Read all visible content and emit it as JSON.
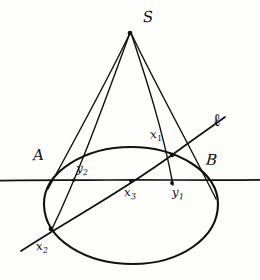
{
  "figure": {
    "kind": "hand-drawn-geometry-diagram",
    "ink_color": "#111111",
    "paper_color": "#fdfdfc",
    "width": 260,
    "height": 280
  },
  "labels": {
    "apex": {
      "text": "S",
      "x": 143,
      "y": 10
    },
    "left_point": {
      "text": "A",
      "x": 33,
      "y": 148
    },
    "right_point": {
      "text": "B",
      "x": 206,
      "y": 153
    },
    "line_l": {
      "text": "ℓ",
      "x": 213,
      "y": 114
    },
    "x1": {
      "base": "x",
      "sub": "1",
      "x": 150,
      "y": 128
    },
    "x2": {
      "base": "x",
      "sub": "2",
      "x": 36,
      "y": 240
    },
    "x3": {
      "base": "x",
      "sub": "3",
      "x": 124,
      "y": 186
    },
    "y1": {
      "base": "y",
      "sub": "1",
      "x": 172,
      "y": 186
    },
    "y2": {
      "base": "y",
      "sub": "2",
      "x": 76,
      "y": 162
    }
  },
  "geometry": {
    "ellipse": {
      "cx": 131,
      "cy": 205,
      "rx": 87,
      "ry": 58
    },
    "horizontal_line": {
      "x1": 0,
      "y1": 180,
      "x2": 260,
      "y2": 180
    },
    "point_S": {
      "x": 130,
      "y": 32
    },
    "point_A": {
      "x": 50,
      "y": 180
    },
    "point_B": {
      "x": 212,
      "y": 180
    },
    "point_x1": {
      "x": 172,
      "y": 155
    },
    "point_x2": {
      "x": 51,
      "y": 228
    },
    "point_x3": {
      "x": 131,
      "y": 192
    },
    "point_y1": {
      "x": 172,
      "y": 184
    },
    "point_y2": {
      "x": 73,
      "y": 180
    },
    "line_l_from": {
      "x": 22,
      "y": 250
    },
    "line_l_to": {
      "x": 224,
      "y": 118
    }
  }
}
